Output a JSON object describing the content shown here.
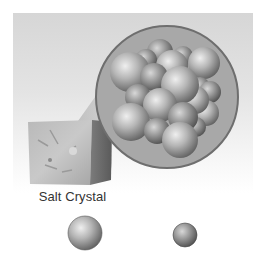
{
  "figure": {
    "crystal_label": "Salt Crystal",
    "colors": {
      "background_top": "#d6d6d6",
      "magnifier_fill": "#a9a9a9",
      "magnifier_rim": "#6e6e6e",
      "sphere_light": "#e6e6e6",
      "sphere_dark": "#6a6a6a",
      "label": "#333333"
    },
    "legend": [
      {
        "name": "large-ion-sphere",
        "size": "large"
      },
      {
        "name": "small-ion-sphere",
        "size": "small"
      }
    ]
  }
}
